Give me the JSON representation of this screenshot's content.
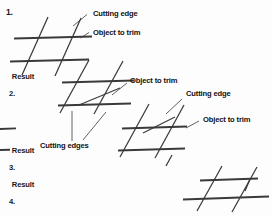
{
  "figure": {
    "stroke_color": "#3a3a3a",
    "text_color": "#111111",
    "background": "#fdfdfd",
    "width": 272,
    "height": 216
  },
  "steps": [
    {
      "id": "step-1",
      "number": "1.",
      "result_word": "Result",
      "result_number": "2.",
      "callouts": [
        {
          "id": "cutting-edge-1",
          "text": "Cutting edge"
        },
        {
          "id": "object-to-trim-1",
          "text": "Object to trim"
        }
      ]
    },
    {
      "id": "step-2",
      "result_word": "Result",
      "result_number": "3.",
      "callouts": [
        {
          "id": "object-to-trim-2",
          "text": "Object to trim"
        }
      ]
    },
    {
      "id": "step-3",
      "result_word": "Result",
      "result_number": "4.",
      "callouts": [
        {
          "id": "cutting-edges-3",
          "text": "Cutting edges"
        },
        {
          "id": "cutting-edge-3",
          "text": "Cutting edge"
        },
        {
          "id": "object-to-trim-3",
          "text": "Object to trim"
        }
      ]
    }
  ],
  "labels": {
    "step_one_number": "1.",
    "cutting_edge_1": "Cutting edge",
    "object_to_trim_1": "Object to trim",
    "result_word_2": "Result",
    "result_num_2": "2.",
    "object_to_trim_2": "Object to trim",
    "cutting_edge_3": "Cutting edge",
    "object_to_trim_3": "Object to trim",
    "result_word_3": "Result",
    "result_num_3": "3.",
    "cutting_edges_3": "Cutting edges",
    "result_word_4": "Result",
    "result_num_4": "4."
  }
}
